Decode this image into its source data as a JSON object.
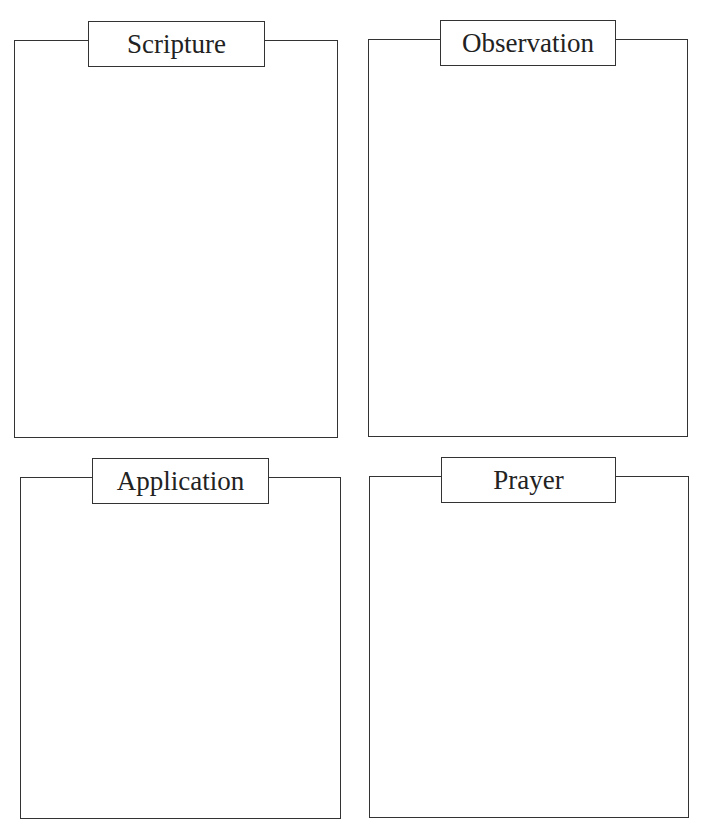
{
  "sections": [
    {
      "title": "Scripture"
    },
    {
      "title": "Observation"
    },
    {
      "title": "Application"
    },
    {
      "title": "Prayer"
    }
  ]
}
